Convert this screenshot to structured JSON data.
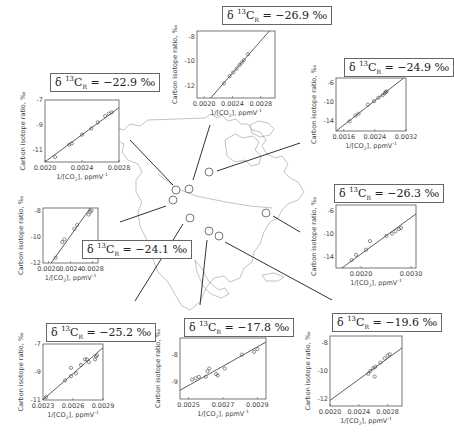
{
  "figure": {
    "y_axis_label": "Carbon isotope ratio, ‰",
    "x_axis_label": "1/[CO2], ppmV-1",
    "site_marker_color": "#555555",
    "line_color": "#333333"
  },
  "chart_data": [
    {
      "id": "nw",
      "type": "scatter",
      "title": "δ13CR = −22.9 ‰",
      "label_value": "−22.9",
      "xlabel": "1/[CO2], ppmV-1",
      "ylabel": "Carbon isotope ratio, ‰",
      "xticks": [
        "0.0020",
        "0.0024",
        "0.0028"
      ],
      "yticks": [
        "-7",
        "-9",
        "-11"
      ],
      "xlim": [
        0.002,
        0.0028
      ],
      "ylim": [
        -12,
        -7
      ],
      "intercept": -22.9,
      "points": [
        [
          0.00211,
          -11.6
        ],
        [
          0.00226,
          -10.6
        ],
        [
          0.00229,
          -10.5
        ],
        [
          0.0024,
          -9.8
        ],
        [
          0.0025,
          -9.3
        ],
        [
          0.00257,
          -8.8
        ],
        [
          0.00265,
          -8.3
        ],
        [
          0.00269,
          -8.1
        ],
        [
          0.00272,
          -8.0
        ]
      ]
    },
    {
      "id": "north",
      "type": "scatter",
      "title": "δ13CR = −26.9 ‰",
      "label_value": "−26.9",
      "xlabel": "1/[CO2], ppmV-1",
      "ylabel": "Carbon isotope ratio, ‰",
      "xticks": [
        "0.0020",
        "0.0024",
        "0.0028"
      ],
      "yticks": [
        "-8",
        "-10",
        "-12"
      ],
      "xlim": [
        0.0019,
        0.003
      ],
      "ylim": [
        -13,
        -7.5
      ],
      "intercept": -26.9,
      "points": [
        [
          0.00228,
          -11.8
        ],
        [
          0.00236,
          -11.2
        ],
        [
          0.00241,
          -10.9
        ],
        [
          0.00246,
          -10.6
        ],
        [
          0.0025,
          -10.3
        ],
        [
          0.00253,
          -10.1
        ],
        [
          0.00256,
          -9.9
        ],
        [
          0.00262,
          -9.4
        ]
      ]
    },
    {
      "id": "ne",
      "type": "scatter",
      "title": "δ13CR = −24.9 ‰",
      "label_value": "−24.9",
      "xlabel": "1/[CO2], ppmV-1",
      "ylabel": "Carbon isotope ratio, ‰",
      "xticks": [
        "0.0016",
        "0.0024",
        "0.0032"
      ],
      "yticks": [
        "-6",
        "-10",
        "-14"
      ],
      "xlim": [
        0.0014,
        0.0032
      ],
      "ylim": [
        -16,
        -5
      ],
      "intercept": -24.9,
      "points": [
        [
          0.00175,
          -14.0
        ],
        [
          0.0019,
          -12.8
        ],
        [
          0.00198,
          -12.4
        ],
        [
          0.00222,
          -10.5
        ],
        [
          0.00238,
          -9.8
        ],
        [
          0.00249,
          -9.1
        ],
        [
          0.0026,
          -8.6
        ],
        [
          0.00265,
          -8.2
        ],
        [
          0.00268,
          -7.9
        ],
        [
          0.0027,
          -7.8
        ]
      ]
    },
    {
      "id": "west",
      "type": "scatter",
      "title": "δ13CR = −24.1 ‰",
      "label_value": "−24.1",
      "xlabel": "1/[CO2], ppmV-1",
      "ylabel": "Carbon isotope ratio, ‰",
      "xticks": [
        "0.0020",
        "0.0024",
        "0.0028"
      ],
      "yticks": [
        "-8",
        "-10",
        "-12"
      ],
      "xlim": [
        0.0019,
        0.0029
      ],
      "ylim": [
        -12,
        -7.8
      ],
      "intercept": -24.1,
      "points": [
        [
          0.00213,
          -11.6
        ],
        [
          0.00225,
          -10.4
        ],
        [
          0.00229,
          -10.2
        ],
        [
          0.00247,
          -9.4
        ],
        [
          0.00252,
          -9.1
        ],
        [
          0.00273,
          -8.3
        ],
        [
          0.00276,
          -8.1
        ],
        [
          0.00278,
          -8.0
        ]
      ]
    },
    {
      "id": "east",
      "type": "scatter",
      "title": "δ13CR = −26.3 ‰",
      "label_value": "−26.3",
      "xlabel": "1/[CO2], ppmV-1",
      "ylabel": "Carbon isotope ratio, ‰",
      "xticks": [
        "0.0020",
        "0.0030"
      ],
      "yticks": [
        "-6",
        "-10",
        "-14"
      ],
      "xlim": [
        0.0015,
        0.0031
      ],
      "ylim": [
        -16,
        -5
      ],
      "intercept": -26.3,
      "points": [
        [
          0.00181,
          -14.6
        ],
        [
          0.0019,
          -13.7
        ],
        [
          0.0021,
          -12.8
        ],
        [
          0.00218,
          -11.3
        ],
        [
          0.00251,
          -10.4
        ],
        [
          0.00262,
          -10.0
        ],
        [
          0.00269,
          -9.6
        ],
        [
          0.00276,
          -9.2
        ],
        [
          0.0028,
          -9.0
        ]
      ]
    },
    {
      "id": "sw",
      "type": "scatter",
      "title": "δ13CR = −25.2 ‰",
      "label_value": "−25.2",
      "xlabel": "1/[CO2], ppmV-1",
      "ylabel": "Carbon isotope ratio, ‰",
      "xticks": [
        "0.0023",
        "0.0026",
        "0.0029"
      ],
      "yticks": [
        "-7",
        "-9",
        "-11"
      ],
      "xlim": [
        0.0023,
        0.0029
      ],
      "ylim": [
        -11,
        -7
      ],
      "intercept": -25.2,
      "points": [
        [
          0.00233,
          -10.8
        ],
        [
          0.00252,
          -9.6
        ],
        [
          0.00258,
          -8.7
        ],
        [
          0.00258,
          -9.3
        ],
        [
          0.00263,
          -9.1
        ],
        [
          0.00268,
          -8.5
        ],
        [
          0.00272,
          -8.1
        ],
        [
          0.00274,
          -8.1
        ],
        [
          0.00276,
          -8.3
        ],
        [
          0.00282,
          -8.1
        ],
        [
          0.00283,
          -7.9
        ],
        [
          0.00284,
          -7.8
        ]
      ]
    },
    {
      "id": "south",
      "type": "scatter",
      "title": "δ13CR = −17.8 ‰",
      "label_value": "−17.8",
      "xlabel": "1/[CO2], ppmV-1",
      "ylabel": "Carbon isotope ratio, ‰",
      "xticks": [
        "0.0025",
        "0.0027",
        "0.0029"
      ],
      "yticks": [
        "-8",
        "-9"
      ],
      "xlim": [
        0.00245,
        0.00295
      ],
      "ylim": [
        -9.6,
        -7.4
      ],
      "intercept": -17.8,
      "points": [
        [
          0.00252,
          -8.9
        ],
        [
          0.00254,
          -8.85
        ],
        [
          0.00256,
          -8.8
        ],
        [
          0.0026,
          -8.8
        ],
        [
          0.00261,
          -8.6
        ],
        [
          0.00262,
          -8.5
        ],
        [
          0.00266,
          -8.7
        ],
        [
          0.00267,
          -8.75
        ],
        [
          0.00271,
          -8.5
        ],
        [
          0.00281,
          -8.0
        ],
        [
          0.00288,
          -7.9
        ],
        [
          0.0029,
          -7.8
        ]
      ]
    },
    {
      "id": "se",
      "type": "scatter",
      "title": "δ13CR = −19.6 ‰",
      "label_value": "−19.6",
      "xlabel": "1/[CO2], ppmV-1",
      "ylabel": "Carbon isotope ratio, ‰",
      "xticks": [
        "0.0020",
        "0.0024",
        "0.0028"
      ],
      "yticks": [
        "-8",
        "-10",
        "-12"
      ],
      "xlim": [
        0.002,
        0.003
      ],
      "ylim": [
        -12.5,
        -7.5
      ],
      "intercept": -19.6,
      "points": [
        [
          0.00253,
          -10.2
        ],
        [
          0.00256,
          -10.0
        ],
        [
          0.0026,
          -9.8
        ],
        [
          0.00262,
          -10.4
        ],
        [
          0.00263,
          -9.7
        ],
        [
          0.0027,
          -9.4
        ],
        [
          0.00276,
          -9.1
        ],
        [
          0.0028,
          -8.9
        ],
        [
          0.00283,
          -8.8
        ]
      ]
    }
  ],
  "sites": [
    {
      "name": "site-nw",
      "x": 176,
      "y": 190
    },
    {
      "name": "site-north",
      "x": 189,
      "y": 189
    },
    {
      "name": "site-ne",
      "x": 209,
      "y": 172
    },
    {
      "name": "site-west",
      "x": 173,
      "y": 207
    },
    {
      "name": "site-west2",
      "x": 173,
      "y": 200
    },
    {
      "name": "site-east",
      "x": 266,
      "y": 213
    },
    {
      "name": "site-sw",
      "x": 190,
      "y": 218
    },
    {
      "name": "site-south",
      "x": 209,
      "y": 231
    },
    {
      "name": "site-se",
      "x": 219,
      "y": 236
    }
  ]
}
